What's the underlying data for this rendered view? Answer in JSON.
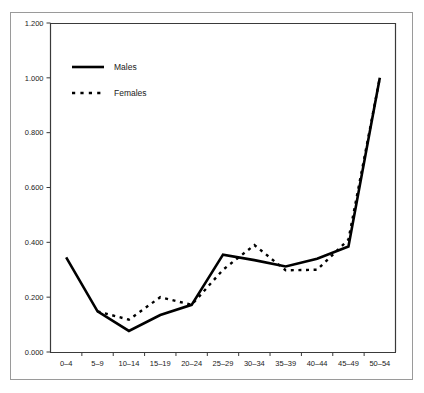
{
  "figure": {
    "background_color": "#ffffff",
    "frame_color": "#9a9a9a",
    "line_color": "#000000"
  },
  "chart_data": {
    "type": "line",
    "title": "",
    "subtitle": "",
    "xlabel": "",
    "ylabel": "",
    "categories": [
      "0–4",
      "5–9",
      "10–14",
      "15–19",
      "20–24",
      "25–29",
      "30–34",
      "35–39",
      "40–44",
      "45–49",
      "50–54"
    ],
    "ylim": [
      0.0,
      1.2
    ],
    "yticks": [
      0.0,
      0.2,
      0.4,
      0.6,
      0.8,
      1.0,
      1.2
    ],
    "ytick_labels": [
      "0.000",
      "0.200",
      "0.400",
      "0.600",
      "0.800",
      "1.000",
      "1.200"
    ],
    "grid": false,
    "legend_position": "upper-left",
    "series": [
      {
        "name": "Males",
        "style": "solid",
        "color": "#000000",
        "values": [
          0.345,
          0.148,
          0.077,
          0.135,
          0.172,
          0.355,
          0.335,
          0.312,
          0.34,
          0.385,
          1.0
        ]
      },
      {
        "name": "Females",
        "style": "dotted",
        "color": "#000000",
        "values": [
          null,
          0.148,
          0.118,
          0.2,
          0.172,
          0.3,
          0.39,
          0.298,
          0.3,
          0.41,
          1.0
        ]
      }
    ]
  },
  "legend": {
    "items": [
      {
        "label": "Males",
        "style": "solid"
      },
      {
        "label": "Females",
        "style": "dotted"
      }
    ]
  }
}
